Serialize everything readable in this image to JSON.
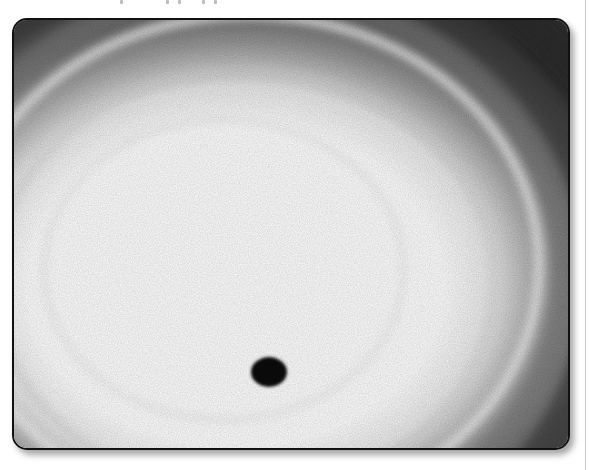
{
  "page": {
    "top_text_fragment": "",
    "figure": {
      "description": "Grayscale image of a swirling planetary vortex with a dark circular shadow spot",
      "frame_style": "rounded-rect",
      "colors": {
        "frame_border": "#111111",
        "spot": "#0a0a0a",
        "bright": "#ffffff",
        "dark_band": "#3a3a3a"
      },
      "spot_label": "shadow-spot"
    }
  }
}
